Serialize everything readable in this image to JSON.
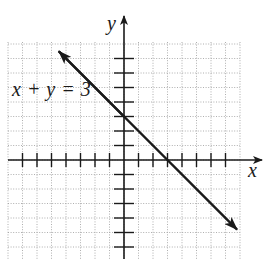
{
  "chart_data": {
    "type": "line",
    "title": "",
    "equation_label": "x + y = 3",
    "xlabel": "x",
    "ylabel": "y",
    "grid": true,
    "xlim": [
      -8,
      8
    ],
    "ylim": [
      -7,
      8
    ],
    "x_ticks": [
      -7,
      -6,
      -5,
      -4,
      -3,
      -2,
      -1,
      1,
      2,
      3,
      4,
      5,
      6,
      7
    ],
    "y_ticks": [
      -6,
      -5,
      -4,
      -3,
      -2,
      -1,
      1,
      2,
      3,
      4,
      5,
      6,
      7
    ],
    "tick_labels_shown": false,
    "series": [
      {
        "name": "x + y = 3",
        "slope": -1,
        "y_intercept": 3,
        "x_intercept": 3,
        "points": [
          [
            -4.5,
            7.5
          ],
          [
            0,
            3
          ],
          [
            3,
            0
          ],
          [
            7.8,
            -4.8
          ]
        ],
        "arrows_both_ends": true,
        "color": "#1a1a1a"
      }
    ]
  },
  "labels": {
    "equation": "x + y = 3",
    "x_axis": "x",
    "y_axis": "y"
  },
  "colors": {
    "axis": "#1a1a1a",
    "grid": "#9a9a9a",
    "line": "#1a1a1a"
  }
}
